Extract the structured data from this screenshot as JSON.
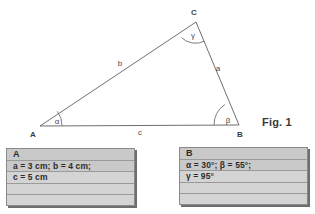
{
  "figure": {
    "caption": "Fig. 1",
    "vertices": [
      {
        "name": "A",
        "label": "A",
        "x": 40,
        "y": 126
      },
      {
        "name": "B",
        "label": "B",
        "x": 239,
        "y": 125
      },
      {
        "name": "C",
        "label": "C",
        "x": 196,
        "y": 22
      }
    ],
    "vertex_label_positions": [
      {
        "label": "A",
        "x": 33,
        "y": 136
      },
      {
        "label": "B",
        "x": 238,
        "y": 136
      },
      {
        "label": "C",
        "x": 193,
        "y": 14
      }
    ],
    "sides": [
      {
        "label": "a",
        "x": 215,
        "y": 68,
        "between": "B-C"
      },
      {
        "label": "b",
        "x": 120,
        "y": 63,
        "between": "A-C"
      },
      {
        "label": "c",
        "x": 140,
        "y": 132,
        "between": "A-B"
      }
    ],
    "angles": [
      {
        "label": "α",
        "vertex": "A",
        "x": 56,
        "y": 122,
        "value": "30°"
      },
      {
        "label": "β",
        "vertex": "B",
        "x": 227,
        "y": 122,
        "value": "55°"
      },
      {
        "label": "γ",
        "vertex": "C",
        "x": 193,
        "y": 36,
        "value": "95°"
      }
    ],
    "line_color": "#6f6f6f"
  },
  "boxes": [
    {
      "id": "A",
      "title": "A",
      "rows": [
        "A",
        "a = 3 cm; b = 4 cm;",
        "c = 5 cm",
        "",
        ""
      ]
    },
    {
      "id": "B",
      "title": "B",
      "rows": [
        "B",
        "α = 30°; β = 55°;",
        "γ = 95°",
        "",
        ""
      ]
    }
  ],
  "colors": {
    "box_fill": "#d4d4d4",
    "box_shade": "#c9c9c9",
    "box_border": "#8a8a8a",
    "rule_line": "#9a9a9a",
    "stroke": "#6f6f6f",
    "text": "#2c2c2c"
  }
}
